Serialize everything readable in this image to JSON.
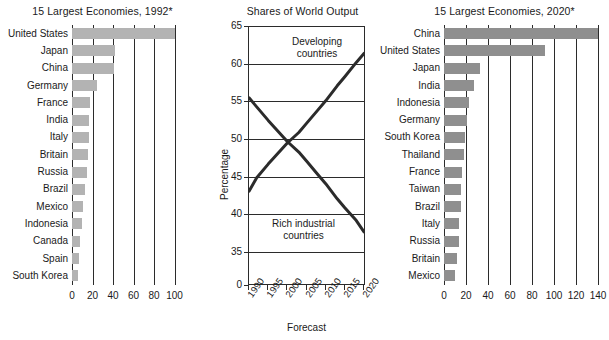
{
  "chart_data": [
    {
      "type": "bar",
      "orientation": "horizontal",
      "title": "15 Largest Economies, 1992*",
      "xlabel": "",
      "ylabel": "",
      "xlim": [
        0,
        105
      ],
      "ticks": [
        0,
        20,
        40,
        60,
        80,
        100
      ],
      "grid": true,
      "categories": [
        "United States",
        "Japan",
        "China",
        "Germany",
        "France",
        "India",
        "Italy",
        "Britain",
        "Russia",
        "Brazil",
        "Mexico",
        "Indonesia",
        "Canada",
        "Spain",
        "South Korea"
      ],
      "values": [
        100,
        42,
        41,
        24,
        18,
        17,
        17,
        16,
        15,
        13,
        11,
        10,
        8,
        7,
        6
      ],
      "bar_color": "#b3b3b3"
    },
    {
      "type": "line",
      "title": "Shares of World Output",
      "xlabel": "Forecast",
      "ylabel": "Percentage",
      "ylim": [
        33,
        65
      ],
      "yticks": [
        0,
        35,
        40,
        45,
        50,
        55,
        60,
        65
      ],
      "xticks": [
        "1990",
        "1995",
        "2000",
        "2005",
        "2010",
        "2015",
        "2020"
      ],
      "grid": true,
      "series": [
        {
          "name": "Developing countries",
          "x": [
            1990,
            1992,
            1995,
            2000,
            2003,
            2005,
            2008,
            2010,
            2013,
            2015,
            2018,
            2020
          ],
          "values": [
            43.2,
            45.0,
            46.8,
            49.6,
            51.0,
            52.2,
            54.0,
            55.2,
            57.2,
            58.4,
            60.3,
            61.5
          ]
        },
        {
          "name": "Rich industrial countries",
          "x": [
            1990,
            1992,
            1995,
            2000,
            2003,
            2005,
            2008,
            2010,
            2013,
            2015,
            2018,
            2020
          ],
          "values": [
            55.6,
            54.4,
            52.6,
            49.8,
            48.4,
            47.2,
            45.4,
            44.2,
            42.2,
            41.0,
            39.3,
            37.8
          ]
        }
      ],
      "line_color": "#2b2b2b"
    },
    {
      "type": "bar",
      "orientation": "horizontal",
      "title": "15 Largest Economies, 2020*",
      "xlabel": "",
      "ylabel": "",
      "xlim": [
        0,
        146
      ],
      "ticks": [
        0,
        20,
        40,
        60,
        80,
        100,
        120,
        140
      ],
      "grid": true,
      "categories": [
        "China",
        "United States",
        "Japan",
        "India",
        "Indonesia",
        "Germany",
        "South Korea",
        "Thailand",
        "France",
        "Taiwan",
        "Brazil",
        "Italy",
        "Russia",
        "Britain",
        "Mexico"
      ],
      "values": [
        140,
        92,
        33,
        27,
        23,
        21,
        19,
        18,
        16,
        15,
        15,
        14,
        14,
        12,
        10
      ],
      "bar_color": "#8f8f8f"
    }
  ],
  "left_chart": {
    "title": "15 Largest Economies, 1992*",
    "categories": [
      "United States",
      "Japan",
      "China",
      "Germany",
      "France",
      "India",
      "Italy",
      "Britain",
      "Russia",
      "Brazil",
      "Mexico",
      "Indonesia",
      "Canada",
      "Spain",
      "South Korea"
    ],
    "values": [
      100,
      42,
      41,
      24,
      18,
      17,
      17,
      16,
      15,
      13,
      11,
      10,
      8,
      7,
      6
    ],
    "ticks": [
      "0",
      "20",
      "40",
      "60",
      "80",
      "100"
    ]
  },
  "mid_chart": {
    "title": "Shares of World Output",
    "ylabel": "Percentage",
    "xcaption": "Forecast",
    "yticks": [
      "65",
      "60",
      "55",
      "50",
      "45",
      "40",
      "35",
      "0"
    ],
    "xticks": [
      "1990",
      "1995",
      "2000",
      "2005",
      "2010",
      "2015",
      "2020"
    ],
    "note_developing_line1": "Developing",
    "note_developing_line2": "countries",
    "note_rich_line1": "Rich industrial",
    "note_rich_line2": "countries"
  },
  "right_chart": {
    "title": "15 Largest Economies, 2020*",
    "categories": [
      "China",
      "United States",
      "Japan",
      "India",
      "Indonesia",
      "Germany",
      "South Korea",
      "Thailand",
      "France",
      "Taiwan",
      "Brazil",
      "Italy",
      "Russia",
      "Britain",
      "Mexico"
    ],
    "values": [
      140,
      92,
      33,
      27,
      23,
      21,
      19,
      18,
      16,
      15,
      15,
      14,
      14,
      12,
      10
    ],
    "ticks": [
      "0",
      "20",
      "40",
      "60",
      "80",
      "100",
      "120",
      "140"
    ]
  },
  "colors": {
    "bar_left": "#b3b3b3",
    "bar_right": "#8f8f8f",
    "axis": "#2b2b2b",
    "text": "#1a1a1a"
  }
}
